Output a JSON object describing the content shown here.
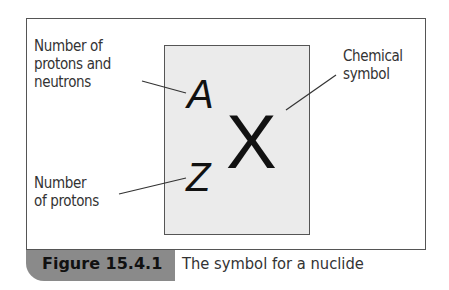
{
  "diagram": {
    "labels": {
      "mass_number": [
        "Number of",
        "protons and",
        "neutrons"
      ],
      "atomic_number": [
        "Number",
        "of protons"
      ],
      "chemical_symbol": [
        "Chemical",
        "symbol"
      ]
    },
    "symbols": {
      "mass": "A",
      "atomic": "Z",
      "element": "X"
    },
    "colors": {
      "box_fill": "#ebebeb",
      "border": "#555555",
      "caption_tab": "#8a8a8a"
    }
  },
  "caption": {
    "number": "Figure 15.4.1",
    "text": "The symbol for a nuclide"
  }
}
